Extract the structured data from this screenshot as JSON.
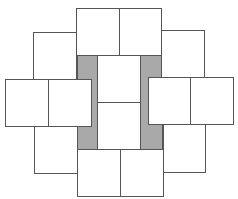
{
  "diagram": {
    "title": "",
    "colors": {
      "stroke": "#555555",
      "tile_fill": "#ffffff",
      "shaded_fill": "#a9a9a9",
      "background": "#ffffff"
    },
    "shaded_regions": [
      {
        "name": "left-gray-bar",
        "x": 77,
        "y": 55,
        "w": 20,
        "h": 94
      },
      {
        "name": "right-gray-bar",
        "x": 140,
        "y": 55,
        "w": 22,
        "h": 94
      }
    ],
    "tiles": [
      {
        "name": "top-left-tile",
        "x": 76,
        "y": 8,
        "w": 43,
        "h": 47
      },
      {
        "name": "top-right-tile",
        "x": 119,
        "y": 8,
        "w": 42,
        "h": 47
      },
      {
        "name": "upper-left-tile",
        "x": 33,
        "y": 32,
        "w": 43,
        "h": 47
      },
      {
        "name": "upper-right-tile",
        "x": 161,
        "y": 30,
        "w": 43,
        "h": 48
      },
      {
        "name": "center-top-tile",
        "x": 97,
        "y": 55,
        "w": 43,
        "h": 47
      },
      {
        "name": "center-bottom-tile",
        "x": 97,
        "y": 102,
        "w": 43,
        "h": 47
      },
      {
        "name": "left-outer-tile",
        "x": 5,
        "y": 79,
        "w": 43,
        "h": 47
      },
      {
        "name": "left-inner-tile",
        "x": 48,
        "y": 79,
        "w": 43,
        "h": 47
      },
      {
        "name": "right-inner-tile",
        "x": 148,
        "y": 77,
        "w": 42,
        "h": 47
      },
      {
        "name": "right-outer-tile",
        "x": 190,
        "y": 77,
        "w": 43,
        "h": 47
      },
      {
        "name": "lower-left-tile",
        "x": 34,
        "y": 126,
        "w": 43,
        "h": 47
      },
      {
        "name": "lower-right-tile",
        "x": 163,
        "y": 124,
        "w": 42,
        "h": 48
      },
      {
        "name": "bottom-left-tile",
        "x": 77,
        "y": 149,
        "w": 43,
        "h": 47
      },
      {
        "name": "bottom-right-tile",
        "x": 120,
        "y": 149,
        "w": 43,
        "h": 47
      }
    ]
  }
}
